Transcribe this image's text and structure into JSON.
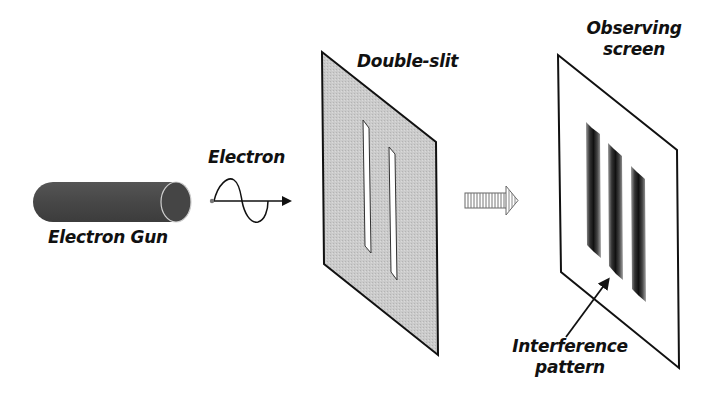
{
  "labels": {
    "electron_gun": "Electron Gun",
    "electron": "Electron",
    "double_slit": "Double-slit",
    "observing_screen_line1": "Observing",
    "observing_screen_line2": "screen",
    "interference_line1": "Interference",
    "interference_line2": "pattern"
  },
  "components": [
    {
      "id": "electron-gun",
      "shape": "cylinder",
      "color": "#4a4a4a"
    },
    {
      "id": "electron-wave",
      "shape": "sine-wave-arrow",
      "color": "#111111"
    },
    {
      "id": "double-slit",
      "shape": "parallelogram-panel",
      "fill": "#c8c8c8",
      "slits": 2
    },
    {
      "id": "propagation-arrow",
      "shape": "hatched-block-arrow",
      "color": "#555555"
    },
    {
      "id": "observing-screen",
      "shape": "parallelogram-panel",
      "fill": "#ffffff",
      "fringes": 3
    }
  ],
  "colors": {
    "outline": "#111111",
    "gun_body": "#4a4a4a",
    "slit_panel": "#c9c9c9",
    "fringe_dark": "#1a1a1a",
    "fringe_mid": "#7a7a7a"
  }
}
